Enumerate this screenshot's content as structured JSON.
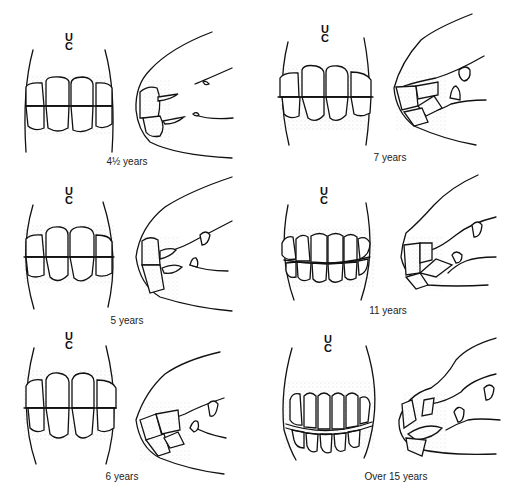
{
  "figure": {
    "panels": [
      {
        "id": "p1",
        "age_label": "4½ years",
        "views": [
          "front-view",
          "side-view"
        ],
        "mark_top": "U",
        "mark_bottom": "C"
      },
      {
        "id": "p2",
        "age_label": "7 years",
        "views": [
          "front-view",
          "side-view"
        ],
        "mark_top": "U",
        "mark_bottom": "C"
      },
      {
        "id": "p3",
        "age_label": "5 years",
        "views": [
          "front-view",
          "side-view"
        ],
        "mark_top": "U",
        "mark_bottom": "C"
      },
      {
        "id": "p4",
        "age_label": "11 years",
        "views": [
          "front-view",
          "side-view"
        ],
        "mark_top": "U",
        "mark_bottom": "C"
      },
      {
        "id": "p5",
        "age_label": "6 years",
        "views": [
          "front-view",
          "side-view"
        ],
        "mark_top": "U",
        "mark_bottom": "C"
      },
      {
        "id": "p6",
        "age_label": "Over 15 years",
        "views": [
          "front-view",
          "side-view"
        ],
        "mark_top": "U",
        "mark_bottom": "C"
      }
    ]
  }
}
